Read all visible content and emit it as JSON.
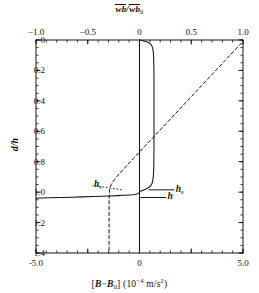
{
  "chart_data": {
    "type": "line",
    "title": "",
    "xlabel": "[B-B0] (10^-4 m/s^2)",
    "ylabel": "d/h",
    "top_xlabel": "wb/wb0",
    "xlim": [
      -5.0,
      5.0
    ],
    "ylim": [
      1.4,
      0.0
    ],
    "top_xlim": [
      -1.0,
      1.0
    ],
    "grid": false,
    "legend": "none",
    "y_inverted": true,
    "axes": {
      "bottom": {
        "label_parts": {
          "bracket_open": "[",
          "var_b": "B",
          "minus": "−",
          "var_b0": "B",
          "sub0": "0",
          "bracket_close": "]",
          "units_open": "(10",
          "exp": "−4",
          "units_rest": " m/s",
          "units_exp": "2",
          "units_close": ")"
        },
        "ticks": [
          -5.0,
          -2.5,
          0,
          2.5,
          5.0
        ],
        "tick_labels": [
          "-5.0",
          "",
          "0",
          "",
          "5.0"
        ],
        "minor_count": 20
      },
      "top": {
        "label_num": "wb",
        "label_den": "wb",
        "label_den_sub": "0",
        "label_slash": "/",
        "ticks": [
          -1.0,
          -0.5,
          0,
          0.5,
          1.0
        ],
        "tick_labels": [
          "−1.0",
          "−0.5",
          "0",
          "0.5",
          "1.0"
        ],
        "minor_count": 20
      },
      "left": {
        "label": "d/h",
        "ticks": [
          0,
          0.2,
          0.4,
          0.6,
          0.8,
          1.0,
          1.2,
          1.4
        ],
        "tick_labels": [
          "0",
          "0.2",
          "0.4",
          "0.6",
          "0.8",
          "1.0",
          "1.2",
          "1.4"
        ],
        "minor_step": 0.05
      }
    },
    "annotations": [
      {
        "name": "h-s",
        "text": "h",
        "sub": "s",
        "x_data": -2.2,
        "y_data": 0.955,
        "leader_to_x": -0.85,
        "leader_to_y": 0.985
      },
      {
        "name": "h-e",
        "text": "h",
        "sub": "e",
        "x_data": 1.75,
        "y_data": 0.985,
        "leader_to_x": 0.45,
        "leader_to_y": 0.985
      },
      {
        "name": "h",
        "text": "h",
        "sub": "",
        "x_data": 1.35,
        "y_data": 1.035,
        "leader_to_x": 0.05,
        "leader_to_y": 1.035
      }
    ],
    "series": [
      {
        "name": "buoyancy-profile",
        "style": "solid",
        "color": "#141414",
        "axis": "bottom",
        "points": [
          [
            0.02,
            0.0
          ],
          [
            0.2,
            0.006
          ],
          [
            0.38,
            0.013
          ],
          [
            0.5,
            0.022
          ],
          [
            0.58,
            0.034
          ],
          [
            0.63,
            0.05
          ],
          [
            0.66,
            0.07
          ],
          [
            0.675,
            0.095
          ],
          [
            0.685,
            0.125
          ],
          [
            0.69,
            0.16
          ],
          [
            0.695,
            0.2
          ],
          [
            0.7,
            0.25
          ],
          [
            0.7,
            0.3
          ],
          [
            0.7,
            0.36
          ],
          [
            0.7,
            0.42
          ],
          [
            0.7,
            0.48
          ],
          [
            0.7,
            0.54
          ],
          [
            0.7,
            0.6
          ],
          [
            0.7,
            0.66
          ],
          [
            0.7,
            0.72
          ],
          [
            0.695,
            0.78
          ],
          [
            0.69,
            0.83
          ],
          [
            0.68,
            0.87
          ],
          [
            0.665,
            0.9
          ],
          [
            0.64,
            0.925
          ],
          [
            0.6,
            0.945
          ],
          [
            0.54,
            0.958
          ],
          [
            0.46,
            0.968
          ],
          [
            0.36,
            0.976
          ],
          [
            0.26,
            0.982
          ],
          [
            0.17,
            0.987
          ],
          [
            0.1,
            0.991
          ],
          [
            0.05,
            0.995
          ],
          [
            0.01,
            1.0
          ],
          [
            -0.03,
            1.005
          ],
          [
            -0.09,
            1.01
          ],
          [
            -0.18,
            1.014
          ],
          [
            -0.32,
            1.017
          ],
          [
            -0.5,
            1.019
          ],
          [
            -0.75,
            1.021
          ],
          [
            -1.05,
            1.023
          ],
          [
            -1.4,
            1.025
          ],
          [
            -1.8,
            1.027
          ],
          [
            -2.25,
            1.029
          ],
          [
            -2.75,
            1.031
          ],
          [
            -3.25,
            1.033
          ],
          [
            -3.75,
            1.035
          ],
          [
            -4.3,
            1.037
          ],
          [
            -4.8,
            1.039
          ],
          [
            -5.0,
            1.04
          ]
        ]
      },
      {
        "name": "heat-flux-profile",
        "style": "dashed",
        "color": "#141414",
        "axis": "top",
        "points_top": [
          [
            0.985,
            0.02
          ],
          [
            0.93,
            0.06
          ],
          [
            0.875,
            0.1
          ],
          [
            0.82,
            0.14
          ],
          [
            0.765,
            0.18
          ],
          [
            0.71,
            0.22
          ],
          [
            0.655,
            0.26
          ],
          [
            0.6,
            0.3
          ],
          [
            0.545,
            0.34
          ],
          [
            0.49,
            0.38
          ],
          [
            0.435,
            0.42
          ],
          [
            0.38,
            0.46
          ],
          [
            0.325,
            0.5
          ],
          [
            0.27,
            0.54
          ],
          [
            0.215,
            0.58
          ],
          [
            0.16,
            0.62
          ],
          [
            0.105,
            0.66
          ],
          [
            0.05,
            0.7
          ],
          [
            -0.005,
            0.74
          ],
          [
            -0.06,
            0.78
          ],
          [
            -0.115,
            0.82
          ],
          [
            -0.17,
            0.86
          ],
          [
            -0.215,
            0.895
          ],
          [
            -0.25,
            0.925
          ],
          [
            -0.272,
            0.95
          ],
          [
            -0.284,
            0.97
          ],
          [
            -0.29,
            0.99
          ],
          [
            -0.292,
            1.01
          ],
          [
            -0.293,
            1.04
          ],
          [
            -0.294,
            1.09
          ],
          [
            -0.294,
            1.15
          ],
          [
            -0.294,
            1.23
          ],
          [
            -0.294,
            1.32
          ],
          [
            -0.294,
            1.4
          ]
        ]
      },
      {
        "name": "zero-reference-line",
        "style": "solid",
        "color": "#141414",
        "axis": "bottom",
        "points": [
          [
            0,
            0.0
          ],
          [
            0,
            1.4
          ]
        ]
      }
    ]
  }
}
